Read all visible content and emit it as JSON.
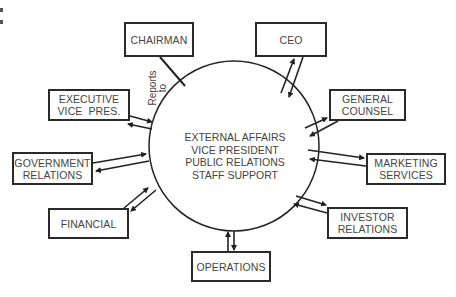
{
  "diagram": {
    "center": {
      "lines": [
        "EXTERNAL AFFAIRS",
        "VICE PRESIDENT",
        "PUBLIC RELATIONS",
        "STAFF SUPPORT"
      ]
    },
    "reports_label": [
      "Reports",
      "to"
    ],
    "nodes": [
      {
        "id": "chairman",
        "lines": [
          "CHAIRMAN"
        ],
        "connection": "reports-to-line"
      },
      {
        "id": "ceo",
        "lines": [
          "CEO"
        ],
        "connection": "two-way-arrows"
      },
      {
        "id": "general-counsel",
        "lines": [
          "GENERAL",
          "COUNSEL"
        ],
        "connection": "two-way-arrows"
      },
      {
        "id": "executive-vice-pres",
        "lines": [
          "EXECUTIVE",
          "VICE  PRES."
        ],
        "connection": "two-way-arrows"
      },
      {
        "id": "government-relations",
        "lines": [
          "GOVERNMENT",
          "RELATIONS"
        ],
        "connection": "two-way-arrows"
      },
      {
        "id": "marketing-services",
        "lines": [
          "MARKETING",
          "SERVICES"
        ],
        "connection": "two-way-arrows"
      },
      {
        "id": "financial",
        "lines": [
          "FINANCIAL"
        ],
        "connection": "two-way-arrows"
      },
      {
        "id": "investor-relations",
        "lines": [
          "INVESTOR",
          "RELATIONS"
        ],
        "connection": "two-way-arrows"
      },
      {
        "id": "operations",
        "lines": [
          "OPERATIONS"
        ],
        "connection": "two-way-arrows"
      }
    ]
  }
}
